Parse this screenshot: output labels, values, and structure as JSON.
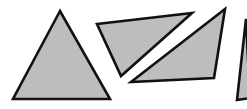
{
  "diagram": {
    "fill_color": "#bdbdbd",
    "stroke_color": "#111111",
    "background": "#ffffff",
    "shapes": [
      {
        "name": "triangle-1",
        "kind": "equilateral-ish triangle",
        "points": "60,11 13,99 110,99"
      },
      {
        "name": "triangle-2",
        "kind": "obtuse triangle",
        "points": "97,24 192,13 121,76"
      },
      {
        "name": "triangle-3",
        "kind": "acute triangle",
        "points": "225,9 131,82 214,78"
      },
      {
        "name": "triangle-4",
        "kind": "partially visible triangle",
        "points": "246,19 237,100 250,98"
      }
    ]
  }
}
